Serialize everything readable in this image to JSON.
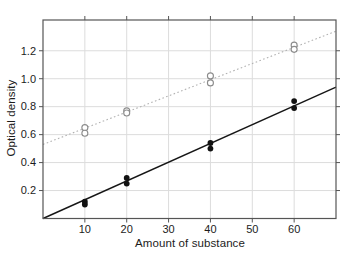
{
  "chart_data": {
    "type": "scatter",
    "title": "",
    "xlabel": "Amount of substance",
    "ylabel": "Optical density",
    "xlim": [
      0,
      70
    ],
    "ylim": [
      0,
      1.42
    ],
    "grid": true,
    "legend": "none",
    "frame": "box-with-outward-ticks-all-sides",
    "xticks": [
      {
        "v": 10,
        "label": "10"
      },
      {
        "v": 20,
        "label": "20"
      },
      {
        "v": 30,
        "label": "30"
      },
      {
        "v": 40,
        "label": "40"
      },
      {
        "v": 50,
        "label": "50"
      },
      {
        "v": 60,
        "label": "60"
      }
    ],
    "yticks": [
      {
        "v": 0.2,
        "label": "0.2"
      },
      {
        "v": 0.4,
        "label": "0.4"
      },
      {
        "v": 0.6,
        "label": "0.6"
      },
      {
        "v": 0.8,
        "label": "0.8"
      },
      {
        "v": 1.0,
        "label": "1.0"
      },
      {
        "v": 1.2,
        "label": "1.2"
      }
    ],
    "series": [
      {
        "name": "dotted-fit-line",
        "kind": "line",
        "style": "dotted",
        "color": "#b2b2b2",
        "width": 1.1,
        "points": [
          [
            0,
            0.53
          ],
          [
            70,
            1.34
          ]
        ]
      },
      {
        "name": "solid-fit-line",
        "kind": "line",
        "style": "solid",
        "color": "#161616",
        "width": 1.4,
        "points": [
          [
            0,
            0.0
          ],
          [
            70,
            0.94
          ]
        ]
      },
      {
        "name": "open-circle-points",
        "kind": "scatter",
        "marker": "open-circle",
        "color": "#8c8c8c",
        "radius": 3.0,
        "points": [
          [
            10,
            0.65
          ],
          [
            10,
            0.61
          ],
          [
            20,
            0.77
          ],
          [
            20,
            0.755
          ],
          [
            40,
            1.02
          ],
          [
            40,
            0.97
          ],
          [
            60,
            1.24
          ],
          [
            60,
            1.21
          ]
        ]
      },
      {
        "name": "filled-circle-points",
        "kind": "scatter",
        "marker": "filled-circle",
        "color": "#111111",
        "radius": 2.9,
        "points": [
          [
            10,
            0.12
          ],
          [
            10,
            0.1
          ],
          [
            20,
            0.29
          ],
          [
            20,
            0.25
          ],
          [
            40,
            0.54
          ],
          [
            40,
            0.5
          ],
          [
            60,
            0.84
          ],
          [
            60,
            0.79
          ]
        ]
      }
    ],
    "colors": {
      "frame": "#555555",
      "grid": "#dcdcdc",
      "tick": "#555555",
      "text": "#1c1c1c",
      "background": "#ffffff"
    }
  }
}
